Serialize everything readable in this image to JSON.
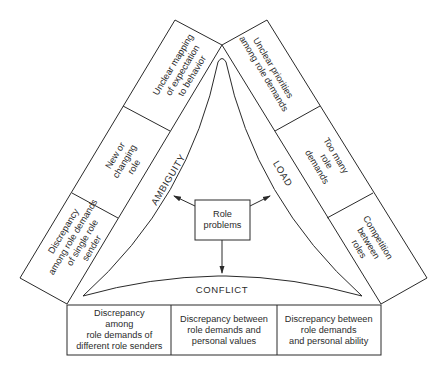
{
  "diagram": {
    "center": {
      "label": "Role\nproblems"
    },
    "categories": {
      "ambiguity": "AMBIGUITY",
      "load": "LOAD",
      "conflict": "CONFLICT"
    },
    "ambiguity_items": [
      {
        "label": "Unclear mapping\nof expectation\nto behavior"
      },
      {
        "label": "New or\nchanging\nrole"
      },
      {
        "label": "Discrepancy\namong role demands\nof single role\nsender"
      }
    ],
    "load_items": [
      {
        "label": "Unclear priorities\namong role demands"
      },
      {
        "label": "Too many\nrole\ndemands"
      },
      {
        "label": "Competition\nbetween\nroles"
      }
    ],
    "conflict_items": [
      {
        "label": "Discrepancy\namong\nrole demands of\ndifferent role senders"
      },
      {
        "label": "Discrepancy between\nrole demands and\npersonal values"
      },
      {
        "label": "Discrepancy between\nrole demands\nand personal ability"
      }
    ],
    "colors": {
      "line": "#2a2a2a",
      "background": "#ffffff",
      "text": "#2b2b2b"
    }
  }
}
